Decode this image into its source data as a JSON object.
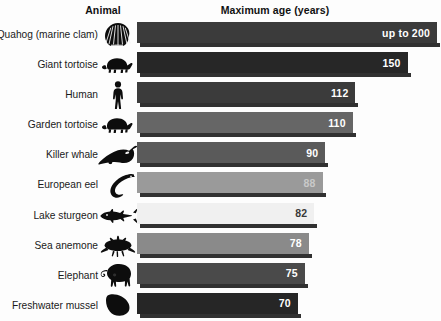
{
  "header": {
    "animal_label": "Animal",
    "value_label": "Maximum age (years)"
  },
  "chart_data": {
    "type": "bar",
    "orientation": "horizontal",
    "title": "Maximum age (years)",
    "xlabel": "Maximum age (years)",
    "ylabel": "Animal",
    "grid": false,
    "legend": null,
    "xlim": [
      0,
      200
    ],
    "categories": [
      "Quahog (marine clam)",
      "Giant tortoise",
      "Human",
      "Garden tortoise",
      "Killer whale",
      "European eel",
      "Lake sturgeon",
      "Sea anemone",
      "Elephant",
      "Freshwater mussel"
    ],
    "values": [
      200,
      150,
      112,
      110,
      90,
      88,
      82,
      78,
      75,
      70
    ],
    "value_labels": [
      "up to 200",
      "150",
      "112",
      "110",
      "90",
      "88",
      "82",
      "78",
      "75",
      "70"
    ],
    "bar_colors": [
      "#3b3b3b",
      "#272727",
      "#3b3b3b",
      "#666666",
      "#5a5a5a",
      "#9a9a9a",
      "#f0f0f0",
      "#8a8a8a",
      "#4a4a4a",
      "#262626"
    ],
    "label_colors": [
      "#ffffff",
      "#ffffff",
      "#ffffff",
      "#ffffff",
      "#ffffff",
      "#c9c9c9",
      "#3a3a3a",
      "#ffffff",
      "#ffffff",
      "#ffffff"
    ],
    "icons": [
      "clam-icon",
      "tortoise-icon",
      "human-icon",
      "tortoise-icon",
      "whale-icon",
      "eel-icon",
      "sturgeon-icon",
      "anemone-icon",
      "elephant-icon",
      "mussel-icon"
    ]
  },
  "rows": [
    {
      "label": "Quahog (marine clam)",
      "value_label": "up to 200",
      "icon": "clam-icon"
    },
    {
      "label": "Giant tortoise",
      "value_label": "150",
      "icon": "tortoise-icon"
    },
    {
      "label": "Human",
      "value_label": "112",
      "icon": "human-icon"
    },
    {
      "label": "Garden tortoise",
      "value_label": "110",
      "icon": "tortoise-icon"
    },
    {
      "label": "Killer whale",
      "value_label": "90",
      "icon": "whale-icon"
    },
    {
      "label": "European eel",
      "value_label": "88",
      "icon": "eel-icon"
    },
    {
      "label": "Lake sturgeon",
      "value_label": "82",
      "icon": "sturgeon-icon"
    },
    {
      "label": "Sea anemone",
      "value_label": "78",
      "icon": "anemone-icon"
    },
    {
      "label": "Elephant",
      "value_label": "75",
      "icon": "elephant-icon"
    },
    {
      "label": "Freshwater mussel",
      "value_label": "70",
      "icon": "mussel-icon"
    }
  ]
}
